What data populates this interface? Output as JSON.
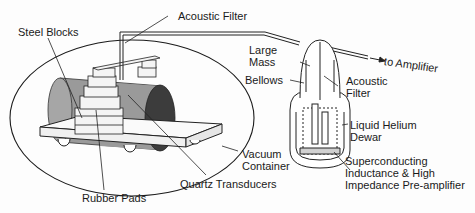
{
  "diagram": {
    "labels": {
      "acoustic_filter_top": "Acoustic Filter",
      "steel_blocks": "Steel Blocks",
      "large_mass": "Large\nMass",
      "bellows": "Bellows",
      "to_amplifier": "to Amplifier",
      "acoustic_filter_right": "Acoustic\nFilter",
      "liquid_helium_dewar": "Liquid Helium\nDewar",
      "vacuum_container": "Vacuum\nContainer",
      "superconducting": "Superconducting\nInductance & High\nImpedance Pre-amplifier",
      "quartz_transducers": "Quartz Transducers",
      "rubber_pads": "Rubber Pads"
    },
    "colors": {
      "line": "#1a1a1a",
      "cylinder_body": "#9a9a9a",
      "cylinder_end": "#3c3c3c",
      "block_fill": "#f4f4f4"
    }
  }
}
